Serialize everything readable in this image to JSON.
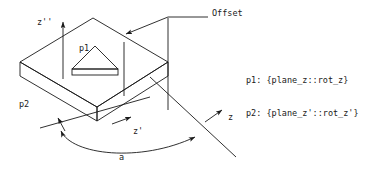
{
  "figure": {
    "type": "technical-line-diagram",
    "background_color": "#ffffff",
    "line_color": "#1a1a1a",
    "labels": {
      "z_double_prime": "z''",
      "p1": "p1",
      "p2": "p2",
      "offset": "Offset",
      "z_prime": "z'",
      "z": "z",
      "angle": "a"
    }
  },
  "legend": {
    "rows": [
      {
        "key": "p1:",
        "value": "{plane_z::rot_z}",
        "text": "p1: {plane_z::rot_z}"
      },
      {
        "key": "p2:",
        "value": "{plane_z'::rot_z'}",
        "text": "p2: {plane_z'::rot_z'}"
      }
    ],
    "line1": "p1: {plane_z::rot_z}",
    "line2": "p2: {plane_z'::rot_z'}"
  }
}
